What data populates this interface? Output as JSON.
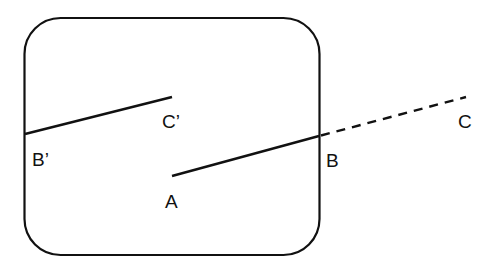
{
  "diagram": {
    "colors": {
      "stroke": "#111111",
      "background": "#ffffff"
    },
    "labels": {
      "A": "A",
      "B": "B",
      "C": "C",
      "B_prime": "B’",
      "C_prime": "C’"
    },
    "segments": [
      {
        "name": "AB",
        "from": "A",
        "to": "B",
        "style": "solid"
      },
      {
        "name": "BC",
        "from": "B",
        "to": "C",
        "style": "dashed"
      },
      {
        "name": "B'C'",
        "from": "B'",
        "to": "C'",
        "style": "solid"
      }
    ]
  }
}
